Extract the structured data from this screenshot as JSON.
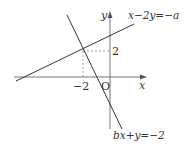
{
  "diagram": {
    "type": "coordinate-plane",
    "axes": {
      "x_label": "x",
      "y_label": "y",
      "origin_label": "O"
    },
    "ticks": {
      "x_tick": "−2",
      "y_tick": "2"
    },
    "lines": [
      {
        "equation": "x−2y=−a",
        "description": "line with positive slope through (−2, 2)"
      },
      {
        "equation": "bx+y=−2",
        "description": "line with negative slope through (−2, 2)"
      }
    ],
    "intersection": {
      "x": -2,
      "y": 2
    },
    "colors": {
      "line": "#333333",
      "axis": "#666666",
      "dashed": "#777777"
    }
  }
}
